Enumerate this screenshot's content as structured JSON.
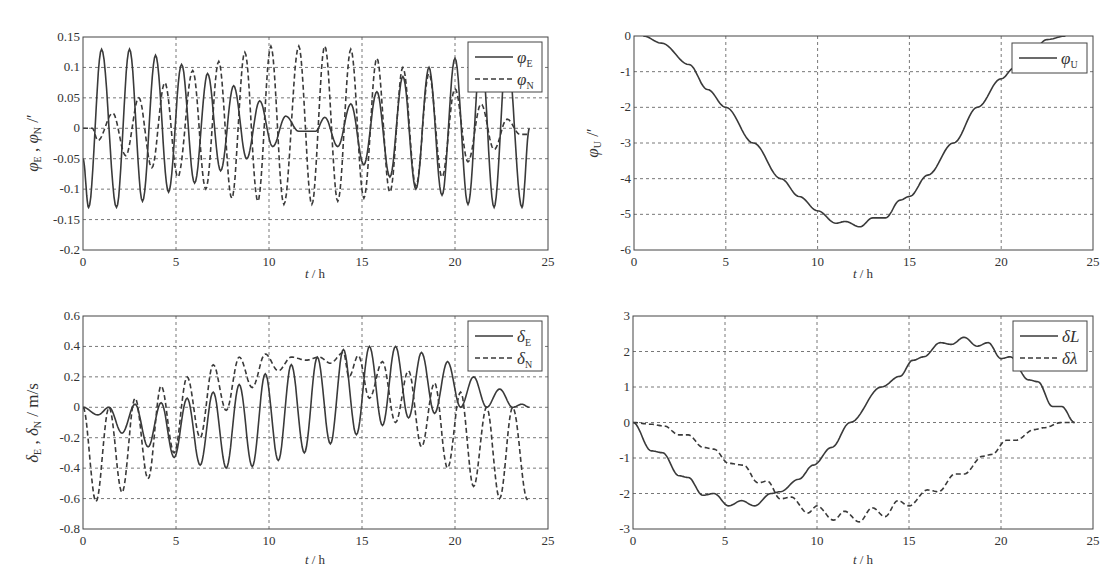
{
  "figure": {
    "caption_fragment": "·· ·· ·· · ··· · · ··",
    "x_tick_labels": [
      "0",
      "5",
      "10",
      "15",
      "20",
      "25"
    ]
  },
  "chart_data": [
    {
      "id": "attitude_EN",
      "type": "line",
      "title": "",
      "xlabel": "t / h",
      "ylabel": "φE , φN  /′",
      "xlim": [
        0,
        25
      ],
      "ylim": [
        -0.2,
        0.15
      ],
      "x_ticks": [
        0,
        5,
        10,
        15,
        20,
        25
      ],
      "y_ticks": [
        -0.2,
        -0.15,
        -0.1,
        -0.05,
        0,
        0.05,
        0.1,
        0.15
      ],
      "y_tick_labels": [
        "-0.2",
        "-0.15",
        "-0.1",
        "-0.05",
        "0",
        "0.05",
        "0.1",
        "0.15"
      ],
      "grid": true,
      "legend_position": "upper right",
      "series": [
        {
          "name": "φE",
          "symbol": "φ",
          "sub": "E",
          "style": "solid",
          "x": [
            0,
            0.3,
            1.0,
            1.8,
            2.5,
            3.2,
            3.9,
            4.6,
            5.3,
            6.0,
            6.7,
            7.4,
            8.1,
            8.8,
            9.5,
            10.2,
            10.9,
            11.6,
            12.5,
            13.0,
            13.7,
            14.4,
            15.1,
            15.8,
            16.5,
            17.2,
            17.9,
            18.6,
            19.3,
            20.0,
            20.7,
            21.4,
            22.1,
            22.8,
            23.6,
            24.0
          ],
          "y": [
            -0.05,
            -0.13,
            0.13,
            -0.13,
            0.13,
            -0.12,
            0.12,
            -0.105,
            0.105,
            -0.09,
            0.09,
            -0.07,
            0.07,
            -0.05,
            0.045,
            -0.03,
            0.02,
            -0.005,
            -0.005,
            0.018,
            -0.03,
            0.04,
            -0.06,
            0.06,
            -0.08,
            0.085,
            -0.1,
            0.1,
            -0.11,
            0.115,
            -0.125,
            0.125,
            -0.13,
            0.13,
            -0.13,
            0.0
          ]
        },
        {
          "name": "φN",
          "symbol": "φ",
          "sub": "N",
          "style": "dashed",
          "x": [
            0,
            0.5,
            0.8,
            1.6,
            2.3,
            3.0,
            3.7,
            4.4,
            5.1,
            5.9,
            6.6,
            7.3,
            8.0,
            8.7,
            9.4,
            10.1,
            10.8,
            11.6,
            12.3,
            13.0,
            13.7,
            14.4,
            15.1,
            15.8,
            16.5,
            17.2,
            17.9,
            18.6,
            19.3,
            20.0,
            20.7,
            21.4,
            22.1,
            22.8,
            23.5,
            24.0
          ],
          "y": [
            0,
            0,
            -0.02,
            0.025,
            -0.045,
            0.05,
            -0.065,
            0.075,
            -0.08,
            0.095,
            -0.1,
            0.11,
            -0.115,
            0.125,
            -0.12,
            0.135,
            -0.125,
            0.135,
            -0.125,
            0.135,
            -0.12,
            0.13,
            -0.115,
            0.115,
            -0.105,
            0.1,
            -0.095,
            0.09,
            -0.08,
            0.065,
            -0.055,
            0.04,
            -0.035,
            0.015,
            -0.01,
            -0.01
          ]
        }
      ]
    },
    {
      "id": "attitude_U",
      "type": "line",
      "title": "",
      "xlabel": "t / h",
      "ylabel": "φU  /′",
      "xlim": [
        0,
        25
      ],
      "ylim": [
        -6,
        0
      ],
      "x_ticks": [
        0,
        5,
        10,
        15,
        20,
        25
      ],
      "y_ticks": [
        -6,
        -5,
        -4,
        -3,
        -2,
        -1,
        0
      ],
      "y_tick_labels": [
        "-6",
        "-5",
        "-4",
        "-3",
        "-2",
        "-1",
        "0"
      ],
      "grid": true,
      "legend_position": "upper right",
      "series": [
        {
          "name": "φU",
          "symbol": "φ",
          "sub": "U",
          "style": "solid",
          "x": [
            0.5,
            1.5,
            3.0,
            4.0,
            5.0,
            6.5,
            8.0,
            9.0,
            10.0,
            11.0,
            11.5,
            12.3,
            13.0,
            13.7,
            14.5,
            15.0,
            16.0,
            17.4,
            18.7,
            20.0,
            20.7,
            21.7,
            22.5,
            23.5
          ],
          "y": [
            0,
            -0.2,
            -0.8,
            -1.5,
            -2.0,
            -3.0,
            -4.0,
            -4.5,
            -4.9,
            -5.25,
            -5.2,
            -5.35,
            -5.1,
            -5.1,
            -4.6,
            -4.5,
            -3.9,
            -3.0,
            -2.0,
            -1.2,
            -0.9,
            -0.4,
            -0.1,
            0
          ]
        }
      ]
    },
    {
      "id": "velocity_EN",
      "type": "line",
      "title": "",
      "xlabel": "t / h",
      "ylabel": "δE , δN / m/s",
      "xlim": [
        0,
        25
      ],
      "ylim": [
        -0.8,
        0.6
      ],
      "x_ticks": [
        0,
        5,
        10,
        15,
        20,
        25
      ],
      "y_ticks": [
        -0.8,
        -0.6,
        -0.4,
        -0.2,
        0,
        0.2,
        0.4,
        0.6
      ],
      "y_tick_labels": [
        "-0.8",
        "-0.6",
        "-0.4",
        "-0.2",
        "0",
        "0.2",
        "0.4",
        "0.6"
      ],
      "grid": true,
      "legend_position": "upper right",
      "series": [
        {
          "name": "δE",
          "symbol": "δ",
          "sub": "E",
          "style": "solid",
          "x": [
            0,
            0.8,
            1.4,
            2.1,
            2.8,
            3.5,
            4.2,
            4.9,
            5.6,
            6.3,
            7.0,
            7.7,
            8.4,
            9.1,
            9.8,
            10.5,
            11.2,
            11.9,
            12.6,
            13.3,
            14.0,
            14.7,
            15.4,
            16.1,
            16.8,
            17.5,
            18.2,
            18.9,
            19.6,
            20.3,
            21.0,
            21.7,
            22.4,
            23.1,
            23.6,
            24.0
          ],
          "y": [
            0,
            -0.05,
            0.0,
            -0.17,
            0.02,
            -0.26,
            0.03,
            -0.33,
            0.06,
            -0.38,
            0.1,
            -0.4,
            0.15,
            -0.39,
            0.22,
            -0.35,
            0.28,
            -0.3,
            0.33,
            -0.24,
            0.38,
            -0.18,
            0.4,
            -0.12,
            0.4,
            -0.07,
            0.36,
            -0.04,
            0.3,
            0.0,
            0.2,
            0.0,
            0.12,
            0.0,
            0.02,
            0
          ]
        },
        {
          "name": "δN",
          "symbol": "δ",
          "sub": "N",
          "style": "dashed",
          "x": [
            0,
            0.7,
            1.4,
            2.1,
            2.8,
            3.5,
            4.2,
            4.9,
            5.6,
            6.3,
            7.0,
            7.7,
            8.4,
            9.1,
            9.8,
            10.5,
            11.2,
            12.0,
            12.7,
            13.3,
            14.0,
            14.3,
            14.8,
            15.4,
            16.1,
            16.8,
            17.5,
            18.2,
            18.9,
            19.6,
            20.3,
            21.0,
            21.7,
            22.4,
            23.1,
            23.9
          ],
          "y": [
            0,
            -0.62,
            0.0,
            -0.56,
            0.06,
            -0.47,
            0.14,
            -0.3,
            0.2,
            -0.2,
            0.28,
            -0.02,
            0.33,
            0.13,
            0.35,
            0.24,
            0.33,
            0.31,
            0.33,
            0.29,
            0.36,
            0.2,
            0.34,
            0.06,
            0.3,
            -0.1,
            0.24,
            -0.26,
            0.16,
            -0.4,
            0.1,
            -0.52,
            0.0,
            -0.6,
            0.0,
            -0.61
          ]
        }
      ]
    },
    {
      "id": "position_L_lambda",
      "type": "line",
      "title": "",
      "xlabel": "t / h",
      "ylabel": "",
      "xlim": [
        0,
        25
      ],
      "ylim": [
        -3,
        3
      ],
      "x_ticks": [
        0,
        5,
        10,
        15,
        20,
        25
      ],
      "y_ticks": [
        -3,
        -2,
        -1,
        0,
        1,
        2,
        3
      ],
      "y_tick_labels": [
        "-3",
        "-2",
        "-1",
        "0",
        "1",
        "2",
        "3"
      ],
      "grid": true,
      "legend_position": "upper right",
      "series": [
        {
          "name": "δL",
          "symbol": "δL",
          "sub": "",
          "style": "solid",
          "x": [
            0,
            1.0,
            1.6,
            2.5,
            3.0,
            3.8,
            4.4,
            5.2,
            5.9,
            6.6,
            7.5,
            8.0,
            9.0,
            9.8,
            10.8,
            11.8,
            13.5,
            14.5,
            15.2,
            15.8,
            16.7,
            17.3,
            18.0,
            18.7,
            19.3,
            20.0,
            20.5,
            21.5,
            22.0,
            22.8,
            23.3,
            24.0
          ],
          "y": [
            0,
            -0.8,
            -0.85,
            -1.5,
            -1.55,
            -2.05,
            -2.0,
            -2.35,
            -2.2,
            -2.35,
            -2.0,
            -1.95,
            -1.6,
            -1.2,
            -0.7,
            0,
            1.0,
            1.3,
            1.75,
            1.85,
            2.25,
            2.2,
            2.4,
            2.15,
            2.25,
            1.8,
            1.85,
            1.2,
            1.15,
            0.45,
            0.45,
            0
          ]
        },
        {
          "name": "δλ",
          "symbol": "δλ",
          "sub": "",
          "style": "dashed",
          "x": [
            0,
            1.0,
            1.7,
            2.5,
            3.0,
            3.8,
            4.4,
            5.2,
            6.0,
            6.8,
            7.3,
            8.0,
            8.6,
            9.5,
            10.0,
            10.9,
            11.5,
            12.3,
            13.0,
            13.7,
            14.4,
            15.0,
            16.0,
            16.6,
            17.5,
            18.0,
            19.0,
            19.5,
            20.3,
            20.8,
            21.8,
            22.3,
            23.3,
            24.0
          ],
          "y": [
            0,
            -0.05,
            -0.1,
            -0.35,
            -0.35,
            -0.7,
            -0.75,
            -1.15,
            -1.2,
            -1.7,
            -1.65,
            -2.15,
            -2.1,
            -2.55,
            -2.35,
            -2.75,
            -2.5,
            -2.8,
            -2.4,
            -2.65,
            -2.2,
            -2.35,
            -1.9,
            -1.95,
            -1.45,
            -1.45,
            -0.95,
            -0.9,
            -0.5,
            -0.5,
            -0.2,
            -0.15,
            0,
            0
          ]
        }
      ]
    }
  ],
  "layout_colors": {
    "line": "#3a3a3a",
    "grid": "#555555",
    "axis": "#444444",
    "text": "#333333"
  }
}
